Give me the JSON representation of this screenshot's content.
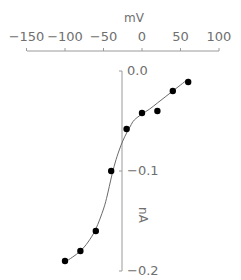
{
  "chart_data": {
    "type": "scatter",
    "title": "",
    "xlabel": "mV",
    "ylabel": "nA",
    "xlim": [
      -150,
      100
    ],
    "ylim": [
      -0.2,
      0.0
    ],
    "x_ticks": [
      -150,
      -100,
      -50,
      0,
      50,
      100
    ],
    "x_tick_labels": [
      "−150",
      "−100",
      "−50",
      "0",
      "50",
      "100"
    ],
    "y_ticks": [
      0.0,
      -0.1,
      -0.2
    ],
    "y_tick_labels": [
      "0.0",
      "−0.1",
      "−0.2"
    ],
    "x_axis_position": "top",
    "y_axis_position": "at x = -25 mV",
    "grid": false,
    "legend": null,
    "series": [
      {
        "name": "measured",
        "style": "filled-circle-markers",
        "x": [
          -100,
          -80,
          -60,
          -40,
          -20,
          0,
          20,
          40,
          60
        ],
        "y": [
          -0.19,
          -0.18,
          -0.16,
          -0.1,
          -0.058,
          -0.042,
          -0.04,
          -0.02,
          -0.011
        ]
      },
      {
        "name": "fit",
        "style": "smooth-line",
        "x": [
          -100,
          -90,
          -80,
          -70,
          -60,
          -50,
          -45,
          -40,
          -35,
          -30,
          -25,
          -20,
          -15,
          -10,
          0,
          10,
          20,
          30,
          40,
          50,
          60
        ],
        "y": [
          -0.191,
          -0.186,
          -0.18,
          -0.171,
          -0.158,
          -0.138,
          -0.124,
          -0.107,
          -0.092,
          -0.08,
          -0.07,
          -0.062,
          -0.055,
          -0.049,
          -0.043,
          -0.038,
          -0.032,
          -0.026,
          -0.02,
          -0.014,
          -0.008
        ]
      }
    ]
  }
}
